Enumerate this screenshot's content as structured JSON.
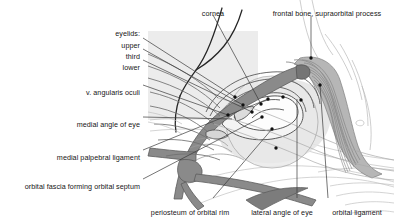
{
  "figure": {
    "type": "anatomical-line-diagram",
    "width": 394,
    "height": 221,
    "colors": {
      "background": "#ffffff",
      "panel_shade": "#e8e8e8",
      "vessel_fill": "#8a8a8a",
      "vessel_stroke": "#5f5f5f",
      "muscle_shade": "#a8a8a8",
      "tissue_light": "#d8d8d8",
      "outline_dark": "#2a2a2a",
      "outline_mid": "#6e6e6e",
      "outline_faint": "#b5b5b5",
      "leader_line": "#3a3a3a",
      "marker_dot": "#111111",
      "text": "#161616"
    }
  },
  "labels": [
    {
      "id": "eyelids-group",
      "name": "eyelids",
      "text": "eyelids:",
      "x": 140,
      "y": 29,
      "align": "right",
      "has_leader": false
    },
    {
      "id": "eyelid-upper",
      "name": "upper-eyelid",
      "text": "upper",
      "x": 140,
      "y": 41,
      "align": "right",
      "has_leader": true
    },
    {
      "id": "eyelid-third",
      "name": "third-eyelid",
      "text": "third",
      "x": 140,
      "y": 52,
      "align": "right",
      "has_leader": true
    },
    {
      "id": "eyelid-lower",
      "name": "lower-eyelid",
      "text": "lower",
      "x": 140,
      "y": 63,
      "align": "right",
      "has_leader": true
    },
    {
      "id": "v-angularis-oculi",
      "name": "vena-angularis-oculi",
      "text": "v. angularis oculi",
      "x": 140,
      "y": 88,
      "align": "right",
      "has_leader": true
    },
    {
      "id": "medial-angle-of-eye",
      "name": "medial-angle-of-eye",
      "text": "medial angle of eye",
      "x": 140,
      "y": 120,
      "align": "right",
      "has_leader": true
    },
    {
      "id": "medial-palpebral-ligament",
      "name": "medial-palpebral-ligament",
      "text": "medial palpebral ligament",
      "x": 140,
      "y": 153,
      "align": "right",
      "has_leader": true
    },
    {
      "id": "orbital-fascia",
      "name": "orbital-fascia-forming-orbital-septum",
      "text": "orbital fascia forming orbital septum",
      "x": 140,
      "y": 182,
      "align": "right",
      "has_leader": true
    },
    {
      "id": "cornea",
      "name": "cornea",
      "text": "cornea",
      "x": 213,
      "y": 9,
      "align": "center",
      "has_leader": true
    },
    {
      "id": "frontal-bone",
      "name": "frontal-bone-supraorbital-process",
      "text": "frontal bone, supraorbital process",
      "x": 327,
      "y": 9,
      "align": "center",
      "has_leader": true
    },
    {
      "id": "periosteum",
      "name": "periosteum-of-orbital-rim",
      "text": "periosteum of orbital rim",
      "x": 190,
      "y": 208,
      "align": "center",
      "has_leader": true
    },
    {
      "id": "lateral-angle-of-eye",
      "name": "lateral-angle-of-eye",
      "text": "lateral angle of eye",
      "x": 282,
      "y": 208,
      "align": "center",
      "has_leader": true
    },
    {
      "id": "orbital-ligament",
      "name": "orbital-ligament",
      "text": "orbital ligament",
      "x": 357,
      "y": 208,
      "align": "center",
      "has_leader": true
    }
  ],
  "leaders": [
    {
      "name": "leader-upper-eyelid",
      "from": [
        143,
        38
      ],
      "to": [
        235,
        97
      ]
    },
    {
      "name": "leader-third-eyelid",
      "from": [
        143,
        49
      ],
      "to": [
        243,
        105
      ]
    },
    {
      "name": "leader-lower-eyelid",
      "from": [
        143,
        60
      ],
      "to": [
        252,
        112
      ]
    },
    {
      "name": "leader-v-angularis-oculi",
      "from": [
        143,
        85
      ],
      "to": [
        228,
        115
      ]
    },
    {
      "name": "leader-medial-angle-of-eye",
      "from": [
        143,
        117
      ],
      "to": [
        232,
        119
      ]
    },
    {
      "name": "leader-medial-palpebral",
      "from": [
        143,
        150
      ],
      "to": [
        268,
        99
      ]
    },
    {
      "name": "leader-orbital-fascia",
      "from": [
        143,
        179
      ],
      "to": [
        262,
        117
      ]
    },
    {
      "name": "leader-cornea",
      "from": [
        213,
        15
      ],
      "to": [
        261,
        104
      ]
    },
    {
      "name": "leader-frontal-bone",
      "from": [
        311,
        16
      ],
      "to": [
        311,
        58
      ]
    },
    {
      "name": "leader-periosteum",
      "from": [
        213,
        198
      ],
      "to": [
        272,
        129
      ]
    },
    {
      "name": "leader-lateral-angle",
      "from": [
        297,
        198
      ],
      "to": [
        297,
        99
      ]
    },
    {
      "name": "leader-orbital-ligament",
      "from": [
        328,
        198
      ],
      "to": [
        320,
        85
      ]
    }
  ],
  "markers": [
    {
      "name": "marker-upper-eyelid",
      "x": 235,
      "y": 97
    },
    {
      "name": "marker-third-eyelid",
      "x": 243,
      "y": 105
    },
    {
      "name": "marker-lower-eyelid",
      "x": 252,
      "y": 112
    },
    {
      "name": "marker-v-angularis-oculi",
      "x": 228,
      "y": 115
    },
    {
      "name": "marker-medial-palpebral",
      "x": 268,
      "y": 99
    },
    {
      "name": "marker-orbital-fascia",
      "x": 262,
      "y": 117
    },
    {
      "name": "marker-cornea",
      "x": 261,
      "y": 104
    },
    {
      "name": "marker-frontal-bone",
      "x": 311,
      "y": 58
    },
    {
      "name": "marker-periosteum",
      "x": 272,
      "y": 129
    },
    {
      "name": "marker-lateral-angle",
      "x": 276,
      "y": 148
    },
    {
      "name": "marker-orbital-ligament",
      "x": 320,
      "y": 85
    },
    {
      "name": "marker-extra-1",
      "x": 283,
      "y": 97
    },
    {
      "name": "marker-extra-2",
      "x": 301,
      "y": 100
    }
  ]
}
